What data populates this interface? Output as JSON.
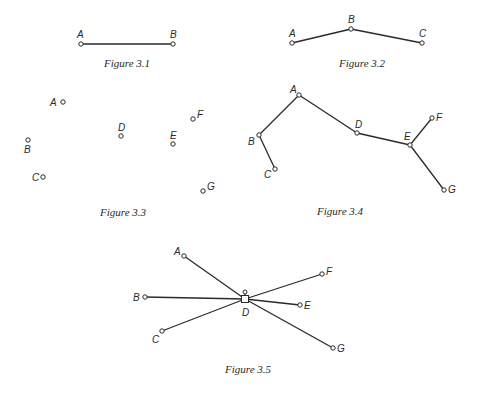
{
  "figures": [
    {
      "id": "fig3_1",
      "caption": "Figure 3.1",
      "caption_pos": [
        127,
        67
      ],
      "nodes": [
        {
          "label": "A",
          "x": 81,
          "y": 44,
          "lx": 77,
          "ly": 38
        },
        {
          "label": "B",
          "x": 173,
          "y": 44,
          "lx": 170,
          "ly": 38
        }
      ],
      "edges": [
        [
          "A",
          "B"
        ]
      ]
    },
    {
      "id": "fig3_2",
      "caption": "Figure 3.2",
      "caption_pos": [
        362,
        67
      ],
      "nodes": [
        {
          "label": "A",
          "x": 292,
          "y": 43,
          "lx": 289,
          "ly": 37
        },
        {
          "label": "B",
          "x": 351,
          "y": 29,
          "lx": 348,
          "ly": 23
        },
        {
          "label": "C",
          "x": 422,
          "y": 43,
          "lx": 419,
          "ly": 37
        }
      ],
      "edges": [
        [
          "A",
          "B"
        ],
        [
          "B",
          "C"
        ]
      ]
    },
    {
      "id": "fig3_3",
      "caption": "Figure 3.3",
      "caption_pos": [
        123,
        216
      ],
      "nodes": [
        {
          "label": "A",
          "x": 63,
          "y": 102,
          "lx": 50,
          "ly": 106
        },
        {
          "label": "B",
          "x": 28,
          "y": 140,
          "lx": 24,
          "ly": 153
        },
        {
          "label": "C",
          "x": 43,
          "y": 177,
          "lx": 32,
          "ly": 181
        },
        {
          "label": "D",
          "x": 121,
          "y": 136,
          "lx": 118,
          "ly": 131
        },
        {
          "label": "E",
          "x": 173,
          "y": 144,
          "lx": 170,
          "ly": 139
        },
        {
          "label": "F",
          "x": 193,
          "y": 119,
          "lx": 197,
          "ly": 118
        },
        {
          "label": "G",
          "x": 203,
          "y": 191,
          "lx": 207,
          "ly": 190
        }
      ],
      "edges": []
    },
    {
      "id": "fig3_4",
      "caption": "Figure 3.4",
      "caption_pos": [
        340,
        215
      ],
      "nodes": [
        {
          "label": "A",
          "x": 299,
          "y": 95,
          "lx": 290,
          "ly": 93
        },
        {
          "label": "B",
          "x": 259,
          "y": 135,
          "lx": 248,
          "ly": 145
        },
        {
          "label": "C",
          "x": 275,
          "y": 169,
          "lx": 264,
          "ly": 178
        },
        {
          "label": "D",
          "x": 357,
          "y": 133,
          "lx": 355,
          "ly": 128
        },
        {
          "label": "E",
          "x": 410,
          "y": 145,
          "lx": 404,
          "ly": 140
        },
        {
          "label": "F",
          "x": 432,
          "y": 118,
          "lx": 436,
          "ly": 121
        },
        {
          "label": "G",
          "x": 444,
          "y": 190,
          "lx": 448,
          "ly": 193
        }
      ],
      "edges": [
        [
          "A",
          "B"
        ],
        [
          "B",
          "C"
        ],
        [
          "A",
          "D"
        ],
        [
          "D",
          "E"
        ],
        [
          "E",
          "F"
        ],
        [
          "E",
          "G"
        ]
      ]
    },
    {
      "id": "fig3_5",
      "caption": "Figure 3.5",
      "caption_pos": [
        248,
        373
      ],
      "hub": {
        "label": "D",
        "x": 245,
        "y": 299,
        "size": 7,
        "lx": 242,
        "ly": 316,
        "knob_y": 292
      },
      "nodes": [
        {
          "label": "A",
          "x": 184,
          "y": 256,
          "lx": 174,
          "ly": 255
        },
        {
          "label": "B",
          "x": 145,
          "y": 297,
          "lx": 133,
          "ly": 301
        },
        {
          "label": "C",
          "x": 162,
          "y": 331,
          "lx": 152,
          "ly": 343
        },
        {
          "label": "F",
          "x": 322,
          "y": 274,
          "lx": 326,
          "ly": 275
        },
        {
          "label": "E",
          "x": 300,
          "y": 305,
          "lx": 304,
          "ly": 309
        },
        {
          "label": "G",
          "x": 333,
          "y": 348,
          "lx": 337,
          "ly": 352
        }
      ],
      "edges": [
        [
          "A",
          "D"
        ],
        [
          "B",
          "D"
        ],
        [
          "C",
          "D"
        ],
        [
          "F",
          "D"
        ],
        [
          "E",
          "D"
        ],
        [
          "G",
          "D"
        ]
      ]
    }
  ]
}
